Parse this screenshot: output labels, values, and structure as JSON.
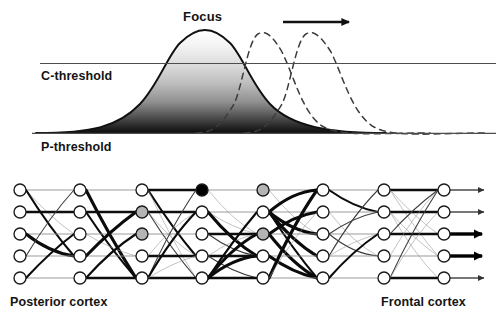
{
  "figure": {
    "width": 501,
    "height": 321,
    "background": "#ffffff"
  },
  "labels": {
    "focus": "Focus",
    "c_threshold": "C-threshold",
    "p_threshold": "P-threshold",
    "posterior_cortex": "Posterior cortex",
    "frontal_cortex": "Frontal cortex"
  },
  "colors": {
    "ink": "#141414",
    "line": "#555555",
    "node_fill": "#ffffff",
    "node_stroke": "#1a1a1a",
    "node_active": "#000000",
    "node_partial": "#b4b4b4",
    "dashed_curve": "#3a3a3a",
    "gradient_top": "#f2f2f2",
    "gradient_bottom": "#101010"
  },
  "chart_data": {
    "type": "line",
    "title": "Focus",
    "xlabel": "",
    "ylabel": "Activation",
    "grid": false,
    "legend": null,
    "xlim": [
      0,
      501
    ],
    "ylim": [
      0,
      1
    ],
    "annotations": [
      {
        "text": "Focus",
        "x": 205,
        "y": 18,
        "target": "solid-curve-peak"
      },
      {
        "text": "C-threshold",
        "x": 41,
        "y": 75,
        "target": "upper-threshold-line"
      },
      {
        "text": "P-threshold",
        "x": 41,
        "y": 146,
        "target": "lower-threshold-line"
      }
    ],
    "reference_lines": [
      {
        "name": "C-threshold",
        "orientation": "horizontal",
        "y_px": 63,
        "x_start": 40,
        "x_end": 495,
        "style": "solid",
        "value": 0.52
      },
      {
        "name": "P-threshold",
        "orientation": "horizontal",
        "y_px": 133,
        "x_start": 32,
        "x_end": 495,
        "style": "solid",
        "value": 0.0
      }
    ],
    "arrow": {
      "label": "direction of focus movement",
      "x_start": 283,
      "x_end": 357,
      "y": 22,
      "direction": "right"
    },
    "series": [
      {
        "name": "current focus",
        "style": "solid",
        "filled": true,
        "fill": "vertical-gradient-dark-bottom",
        "peak_x": 205,
        "peak_y": 35,
        "amplitude": 1.0,
        "sigma": 46,
        "baseline_y": 133
      },
      {
        "name": "next focus position",
        "style": "dashed",
        "filled": false,
        "peak_x": 258,
        "peak_y": 37,
        "amplitude": 0.96,
        "sigma": 40,
        "baseline_y": 133
      },
      {
        "name": "later focus position",
        "style": "dashed",
        "filled": false,
        "peak_x": 306,
        "peak_y": 37,
        "amplitude": 0.96,
        "sigma": 42,
        "baseline_y": 133
      }
    ]
  },
  "network": {
    "layer_count": 8,
    "rows": 5,
    "node_radius": 6,
    "column_x": [
      20,
      80,
      142,
      202,
      263,
      323,
      384,
      444
    ],
    "row_y": [
      190,
      212,
      234,
      256,
      278
    ],
    "node_states": [
      [
        "open",
        "open",
        "open",
        "open",
        "open"
      ],
      [
        "open",
        "open",
        "open",
        "open",
        "open"
      ],
      [
        "open",
        "partial",
        "partial",
        "open",
        "open"
      ],
      [
        "active",
        "open",
        "open",
        "open",
        "open"
      ],
      [
        "partial",
        "open",
        "partial",
        "open",
        "open"
      ],
      [
        "open",
        "open",
        "open",
        "open",
        "open"
      ],
      [
        "open",
        "open",
        "open",
        "open",
        "open"
      ],
      [
        "open",
        "open",
        "open",
        "open",
        "open"
      ]
    ],
    "output_arrows": [
      {
        "row": 1,
        "weight": "thin"
      },
      {
        "row": 2,
        "weight": "thin"
      },
      {
        "row": 3,
        "weight": "thick"
      },
      {
        "row": 4,
        "weight": "thick"
      },
      {
        "row": 5,
        "weight": "thin"
      }
    ]
  }
}
